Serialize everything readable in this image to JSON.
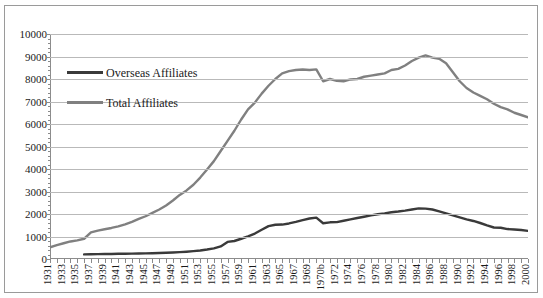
{
  "chart_data": {
    "type": "line",
    "title": "",
    "xlabel": "",
    "ylabel": "",
    "ylim": [
      0,
      10000
    ],
    "ytick_step": 1000,
    "yticks": [
      0,
      1000,
      2000,
      3000,
      4000,
      5000,
      6000,
      7000,
      8000,
      9000,
      10000
    ],
    "grid": true,
    "legend_position": "upper-left-inside",
    "categories": [
      "1931",
      "1932",
      "1933",
      "1934",
      "1935",
      "1936",
      "1937",
      "1938",
      "1939",
      "1940",
      "1941",
      "1942",
      "1943",
      "1944",
      "1945",
      "1946",
      "1947",
      "1948",
      "1949",
      "1950",
      "1951",
      "1952",
      "1953",
      "1954",
      "1955",
      "1956",
      "1957",
      "1958",
      "1959",
      "1960",
      "1961",
      "1962",
      "1963",
      "1964",
      "1965",
      "1966",
      "1967",
      "1968",
      "1969",
      "1970a",
      "1970b",
      "1971",
      "1972",
      "1973",
      "1974",
      "1975",
      "1976",
      "1977",
      "1978",
      "1979",
      "1980",
      "1981",
      "1982",
      "1983",
      "1984",
      "1985",
      "1986",
      "1987",
      "1988",
      "1989",
      "1990",
      "1991",
      "1992",
      "1993",
      "1994",
      "1995",
      "1996",
      "1997",
      "1998",
      "1999",
      "2000"
    ],
    "tick_label_interval": 2,
    "series": [
      {
        "name": "Overseas Affiliates",
        "color": "#3a3a3a",
        "start_category": "1936",
        "values": [
          null,
          null,
          null,
          null,
          null,
          205,
          210,
          215,
          220,
          225,
          230,
          235,
          240,
          245,
          250,
          258,
          268,
          278,
          290,
          305,
          325,
          350,
          380,
          420,
          470,
          560,
          760,
          800,
          900,
          1010,
          1130,
          1300,
          1460,
          1520,
          1530,
          1580,
          1650,
          1730,
          1800,
          1840,
          1590,
          1630,
          1640,
          1700,
          1760,
          1820,
          1880,
          1940,
          1990,
          2030,
          2080,
          2110,
          2150,
          2200,
          2250,
          2240,
          2200,
          2120,
          2030,
          1940,
          1850,
          1760,
          1690,
          1600,
          1490,
          1400,
          1390,
          1330,
          1310,
          1290,
          1250
        ]
      },
      {
        "name": "Total Affiliates",
        "color": "#808080",
        "start_category": "1931",
        "values": [
          520,
          620,
          700,
          780,
          830,
          900,
          1180,
          1260,
          1320,
          1380,
          1450,
          1540,
          1650,
          1780,
          1900,
          2050,
          2200,
          2380,
          2600,
          2850,
          3050,
          3300,
          3620,
          3980,
          4350,
          4800,
          5250,
          5700,
          6200,
          6650,
          6950,
          7350,
          7700,
          8000,
          8250,
          8350,
          8400,
          8420,
          8400,
          8430,
          7900,
          8000,
          7920,
          7900,
          7980,
          8000,
          8100,
          8150,
          8200,
          8250,
          8400,
          8450,
          8600,
          8800,
          8950,
          9050,
          8950,
          8900,
          8700,
          8300,
          7900,
          7600,
          7400,
          7250,
          7100,
          6900,
          6750,
          6650,
          6500,
          6400,
          6300
        ]
      }
    ]
  },
  "legend": {
    "items": [
      {
        "label": "Overseas Affiliates",
        "color": "#3a3a3a"
      },
      {
        "label": "Total Affiliates",
        "color": "#808080"
      }
    ]
  }
}
